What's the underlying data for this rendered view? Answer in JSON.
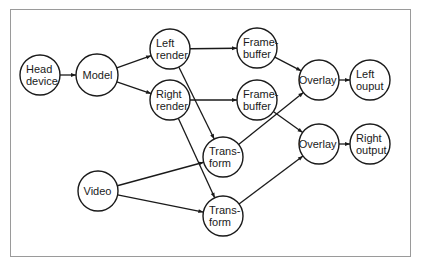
{
  "diagram": {
    "type": "dataflow",
    "colors": {
      "stroke": "#1a1a1a",
      "border": "#9a9a9a",
      "background": "#ffffff"
    },
    "nodes": [
      {
        "id": "head",
        "lines": [
          "Head",
          "device"
        ],
        "x": 40,
        "y": 75,
        "r": 20
      },
      {
        "id": "model",
        "lines": [
          "Model"
        ],
        "x": 97,
        "y": 75,
        "r": 21
      },
      {
        "id": "lrender",
        "lines": [
          "Left",
          "render"
        ],
        "x": 170,
        "y": 49,
        "r": 20
      },
      {
        "id": "rrender",
        "lines": [
          "Right",
          "render"
        ],
        "x": 170,
        "y": 100,
        "r": 20
      },
      {
        "id": "fb1",
        "lines": [
          "Frame-",
          "buffer"
        ],
        "x": 257,
        "y": 48,
        "r": 20
      },
      {
        "id": "fb2",
        "lines": [
          "Frame-",
          "buffer"
        ],
        "x": 257,
        "y": 100,
        "r": 20
      },
      {
        "id": "ov1",
        "lines": [
          "Overlay"
        ],
        "x": 319,
        "y": 80,
        "r": 20
      },
      {
        "id": "lout",
        "lines": [
          "Left",
          "ouput"
        ],
        "x": 370,
        "y": 80,
        "r": 20
      },
      {
        "id": "ov2",
        "lines": [
          "Overlay"
        ],
        "x": 319,
        "y": 144,
        "r": 20
      },
      {
        "id": "rout",
        "lines": [
          "Right",
          "output"
        ],
        "x": 370,
        "y": 144,
        "r": 20
      },
      {
        "id": "tf1",
        "lines": [
          "Trans-",
          "form"
        ],
        "x": 223,
        "y": 157,
        "r": 20
      },
      {
        "id": "tf2",
        "lines": [
          "Trans-",
          "form"
        ],
        "x": 223,
        "y": 216,
        "r": 20
      },
      {
        "id": "video",
        "lines": [
          "Video"
        ],
        "x": 98,
        "y": 191,
        "r": 20
      }
    ],
    "edges": [
      {
        "from": "head",
        "to": "model"
      },
      {
        "from": "model",
        "to": "lrender"
      },
      {
        "from": "model",
        "to": "rrender"
      },
      {
        "from": "lrender",
        "to": "fb1"
      },
      {
        "from": "lrender",
        "to": "tf1"
      },
      {
        "from": "rrender",
        "to": "fb2"
      },
      {
        "from": "rrender",
        "to": "tf2"
      },
      {
        "from": "fb1",
        "to": "ov1"
      },
      {
        "from": "fb2",
        "to": "ov2"
      },
      {
        "from": "tf1",
        "to": "ov1"
      },
      {
        "from": "tf2",
        "to": "ov2"
      },
      {
        "from": "video",
        "to": "tf1"
      },
      {
        "from": "video",
        "to": "tf2"
      },
      {
        "from": "ov1",
        "to": "lout"
      },
      {
        "from": "ov2",
        "to": "rout"
      }
    ]
  }
}
